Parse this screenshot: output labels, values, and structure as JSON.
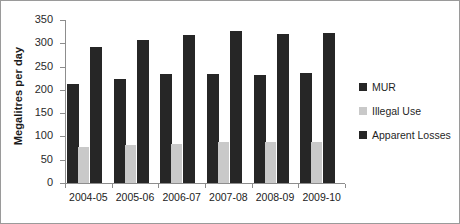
{
  "chart_data": {
    "type": "bar",
    "title": "",
    "xlabel": "",
    "ylabel": "Megalitres per day",
    "ylim": [
      0,
      350
    ],
    "yticks": [
      0,
      50,
      100,
      150,
      200,
      250,
      300,
      350
    ],
    "grid": false,
    "legend_position": "right",
    "categories": [
      "2004-05",
      "2005-06",
      "2006-07",
      "2007-08",
      "2008-09",
      "2009-10"
    ],
    "series": [
      {
        "name": "MUR",
        "color": "#262626",
        "values": [
          212,
          224,
          234,
          235,
          231,
          237
        ]
      },
      {
        "name": "Illegal Use",
        "color": "#c9c9c9",
        "values": [
          77,
          82,
          83,
          88,
          88,
          88
        ]
      },
      {
        "name": "Apparent Losses",
        "color": "#262626",
        "values": [
          291,
          307,
          317,
          326,
          319,
          323
        ]
      }
    ]
  }
}
